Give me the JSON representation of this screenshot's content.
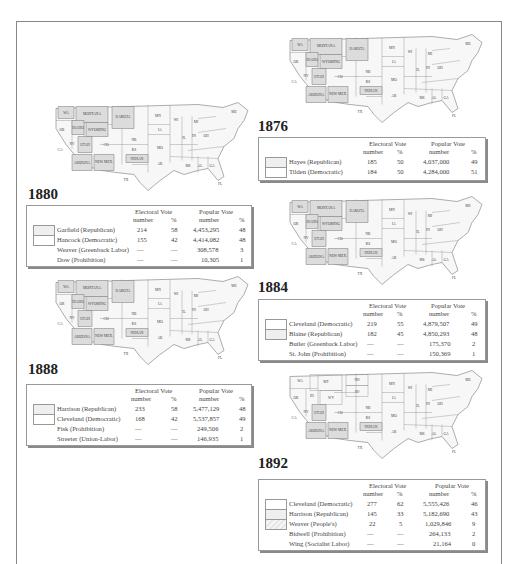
{
  "credit": "Wadsworth/Cengage Learning",
  "colors": {
    "territory": "#dcdcdc",
    "state": "#f7f7f7",
    "border": "#777777",
    "shadow": "#8a8a8a"
  },
  "headers": {
    "electoral": "Electoral Vote",
    "popular": "Popular Vote",
    "number": "number",
    "percent": "%"
  },
  "elections": {
    "e1876": {
      "year": "1876",
      "rows": [
        {
          "name": "Hayes (Republican)",
          "ev": "185",
          "evp": "50",
          "pv": "4,037,000",
          "pvp": "49"
        },
        {
          "name": "Tilden (Democratic)",
          "ev": "184",
          "evp": "50",
          "pv": "4,284,000",
          "pvp": "51"
        }
      ]
    },
    "e1880": {
      "year": "1880",
      "rows": [
        {
          "name": "Garfield (Republican)",
          "ev": "214",
          "evp": "58",
          "pv": "4,453,295",
          "pvp": "48"
        },
        {
          "name": "Hancock (Democratic)",
          "ev": "155",
          "evp": "42",
          "pv": "4,414,082",
          "pvp": "48"
        },
        {
          "name": "Weaver (Greenback Labor)",
          "ev": "—",
          "evp": "—",
          "pv": "308,578",
          "pvp": "3"
        },
        {
          "name": "Dow (Prohibition)",
          "ev": "—",
          "evp": "—",
          "pv": "10,305",
          "pvp": "1"
        }
      ]
    },
    "e1884": {
      "year": "1884",
      "rows": [
        {
          "name": "Cleveland (Democratic)",
          "ev": "219",
          "evp": "55",
          "pv": "4,879,507",
          "pvp": "49"
        },
        {
          "name": "Blaine (Republican)",
          "ev": "182",
          "evp": "45",
          "pv": "4,850,293",
          "pvp": "48"
        },
        {
          "name": "Butler (Greenback Labor)",
          "ev": "—",
          "evp": "—",
          "pv": "175,370",
          "pvp": "2"
        },
        {
          "name": "St. John (Prohibition)",
          "ev": "—",
          "evp": "—",
          "pv": "150,369",
          "pvp": "1"
        }
      ]
    },
    "e1888": {
      "year": "1888",
      "rows": [
        {
          "name": "Harrison (Republican)",
          "ev": "233",
          "evp": "58",
          "pv": "5,477,129",
          "pvp": "48"
        },
        {
          "name": "Cleveland (Democratic)",
          "ev": "168",
          "evp": "42",
          "pv": "5,537,857",
          "pvp": "49"
        },
        {
          "name": "Fisk (Prohibition)",
          "ev": "—",
          "evp": "—",
          "pv": "249,506",
          "pvp": "2"
        },
        {
          "name": "Streeter (Union-Labor)",
          "ev": "—",
          "evp": "—",
          "pv": "146,935",
          "pvp": "1"
        }
      ]
    },
    "e1892": {
      "year": "1892",
      "rows": [
        {
          "name": "Cleveland (Democratic)",
          "ev": "277",
          "evp": "62",
          "pv": "5,555,426",
          "pvp": "46"
        },
        {
          "name": "Harrison (Republican)",
          "ev": "145",
          "evp": "33",
          "pv": "5,182,690",
          "pvp": "43"
        },
        {
          "name": "Weaver (People's)",
          "ev": "22",
          "evp": "5",
          "pv": "1,029,846",
          "pvp": "9"
        },
        {
          "name": "Bidwell (Prohibition)",
          "ev": "—",
          "evp": "—",
          "pv": "264,133",
          "pvp": "2"
        },
        {
          "name": "Wing (Socialist Labor)",
          "ev": "—",
          "evp": "—",
          "pv": "21,164",
          "pvp": "0"
        }
      ]
    }
  },
  "map_labels": {
    "territories_early": [
      "WA TERR.",
      "MONTANA TERR.",
      "DAKOTA TERR.",
      "IDAHO TERR.",
      "WYOMING TERR.",
      "UTAH TERR.",
      "ARIZONA TERR.",
      "NEW MEXICO TERR.",
      "INDIAN TERR."
    ],
    "territories_1892": [
      "UTAH TERR.",
      "ARIZONA TERR.",
      "NEW MEXICO TERR.",
      "INDIAN TERR."
    ],
    "states_sample": [
      "OR",
      "CA",
      "NV",
      "CO",
      "NB",
      "KS",
      "TX",
      "MN",
      "IA",
      "MO",
      "AR",
      "LA",
      "WI",
      "IL",
      "MI",
      "IN",
      "OH",
      "KY",
      "TN",
      "MS",
      "AL",
      "GA",
      "FL",
      "SC",
      "NC",
      "VA",
      "WV",
      "PA",
      "NY",
      "VT",
      "NH",
      "ME",
      "MA",
      "RI",
      "CT",
      "NJ",
      "DE",
      "MD"
    ]
  }
}
